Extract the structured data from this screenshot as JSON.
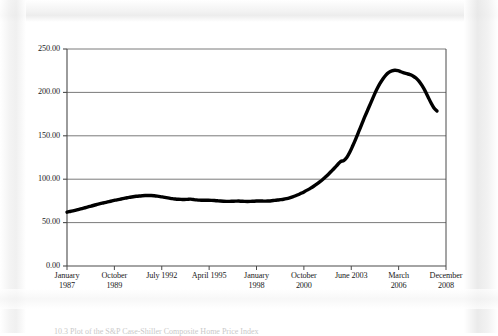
{
  "figure": {
    "caption": "10.3  Plot of the S&P Case-Shiller Composite Home Price Index"
  },
  "chart_data": {
    "type": "line",
    "title": "",
    "xlabel": "",
    "ylabel": "",
    "grid": true,
    "legend": "none",
    "ylim": [
      0,
      250
    ],
    "yticks": [
      "0.00",
      "50.00",
      "100.00",
      "150.00",
      "200.00",
      "250.00"
    ],
    "ytick_values": [
      0,
      50,
      100,
      150,
      200,
      250
    ],
    "xtick_labels": [
      {
        "line1": "January",
        "line2": "1987"
      },
      {
        "line1": "October",
        "line2": "1989"
      },
      {
        "line1": "July 1992",
        "line2": ""
      },
      {
        "line1": "April 1995",
        "line2": ""
      },
      {
        "line1": "January",
        "line2": "1998"
      },
      {
        "line1": "October",
        "line2": "2000"
      },
      {
        "line1": "June 2003",
        "line2": ""
      },
      {
        "line1": "March",
        "line2": "2006"
      },
      {
        "line1": "December",
        "line2": "2008"
      }
    ],
    "series": [
      {
        "name": "Home Price Index",
        "color": "#000000",
        "x": [
          0,
          1,
          2,
          3,
          4,
          5,
          6,
          7,
          8,
          9,
          10,
          11,
          12,
          13,
          14,
          15,
          16,
          17,
          18,
          19,
          20,
          21,
          22,
          23,
          24,
          25,
          26,
          27,
          28,
          29,
          30,
          31,
          32,
          33,
          34,
          35,
          36,
          37,
          38,
          39,
          40,
          41,
          42,
          43,
          44,
          45,
          46,
          47,
          48,
          49,
          50,
          51,
          52,
          53,
          54,
          55,
          56,
          57,
          58,
          59,
          60,
          61,
          62,
          63,
          64,
          65,
          66,
          67,
          68,
          69,
          70,
          71,
          72,
          73,
          74,
          75,
          76,
          77,
          78,
          79,
          80,
          81,
          82,
          83,
          84,
          85,
          86,
          87,
          88,
          89,
          90,
          91,
          92,
          93,
          94,
          95,
          96,
          97,
          98,
          99,
          100
        ],
        "values": [
          62.0,
          62.8,
          63.6,
          64.4,
          65.3,
          66.2,
          67.1,
          68.0,
          69.0,
          70.0,
          70.9,
          71.8,
          72.6,
          73.4,
          74.2,
          75.0,
          75.8,
          76.5,
          77.2,
          77.9,
          78.6,
          79.2,
          79.8,
          80.3,
          80.7,
          81.0,
          81.2,
          81.3,
          81.2,
          80.9,
          80.5,
          80.0,
          79.4,
          78.8,
          78.2,
          77.6,
          77.2,
          76.9,
          76.7,
          76.6,
          76.8,
          77.0,
          76.6,
          76.2,
          75.9,
          75.8,
          75.7,
          75.7,
          75.6,
          75.4,
          75.1,
          74.8,
          74.6,
          74.5,
          74.5,
          74.6,
          74.7,
          74.8,
          74.6,
          74.4,
          74.3,
          74.4,
          74.6,
          74.8,
          74.9,
          74.8,
          74.7,
          74.9,
          75.2,
          75.6,
          76.0,
          76.4,
          76.9,
          77.6,
          78.5,
          79.6,
          80.9,
          82.4,
          84.0,
          85.8,
          87.7,
          89.7,
          91.9,
          94.3,
          96.9,
          99.7,
          102.8,
          106.1,
          109.6,
          113.2,
          116.9,
          120.4,
          121.5,
          125.0,
          131.0,
          138.5,
          146.5,
          155.0,
          163.5,
          172.0,
          180.0
        ],
        "values_tail": [
          188.0,
          196.0,
          203.5,
          210.0,
          215.5,
          220.0,
          223.0,
          224.8,
          225.5,
          225.0,
          223.8,
          222.5,
          221.5,
          220.5,
          219.0,
          216.5,
          213.0,
          208.0,
          202.0,
          195.0,
          188.0,
          182.0,
          178.5
        ]
      }
    ],
    "peak": {
      "value": 225.5,
      "label": "",
      "approx_date": "early 2006"
    },
    "start": {
      "value": 62.0,
      "approx_date": "January 1987"
    },
    "end": {
      "value": 178.5,
      "approx_date": "December 2008"
    }
  },
  "axes": {
    "plot_left_px": 67,
    "plot_right_px": 446,
    "plot_top_px": 49,
    "plot_bottom_px": 266
  }
}
